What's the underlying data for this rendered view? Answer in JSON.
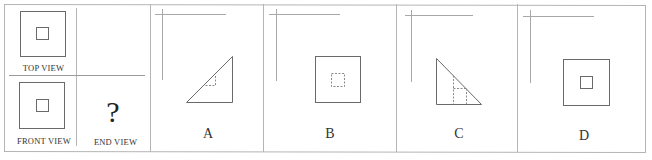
{
  "question_panel": {
    "views": [
      {
        "id": "top",
        "label": "TOP VIEW",
        "shape": "square-with-inner-square"
      },
      {
        "id": "front",
        "label": "FRONT VIEW",
        "shape": "square-with-inner-square"
      },
      {
        "id": "end",
        "label": "END VIEW",
        "shape": "unknown",
        "placeholder": "?"
      }
    ]
  },
  "options": [
    {
      "letter": "A",
      "shape": "right-triangle-rising-right",
      "hidden_feature": "dashed small square under hypotenuse"
    },
    {
      "letter": "B",
      "shape": "square",
      "hidden_feature": "dashed inner square"
    },
    {
      "letter": "C",
      "shape": "right-triangle-falling-right",
      "hidden_feature": "dashed rectangle lines under hypotenuse"
    },
    {
      "letter": "D",
      "shape": "square",
      "hidden_feature": "solid inner square"
    }
  ],
  "colors": {
    "frame": "#b5b5b5",
    "line": "#6a6a6a",
    "dashed": "#8a8a8a",
    "axis_mark": "#a8a8a8"
  }
}
